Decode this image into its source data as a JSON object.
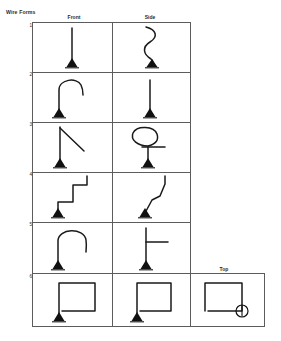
{
  "document": {
    "title": "Wire Forms"
  },
  "table": {
    "headers": {
      "front": "Front",
      "side": "Side",
      "top": "Top"
    },
    "row_numbers": [
      "1",
      "2",
      "3",
      "4",
      "5",
      "6"
    ],
    "rows": [
      {
        "number": "1",
        "front": {
          "shape_name": "straight-vertical-wire-on-base"
        },
        "side": {
          "shape_name": "s-curve-wavy-wire-on-base"
        }
      },
      {
        "number": "2",
        "front": {
          "shape_name": "hook-candy-cane-wire-on-base"
        },
        "side": {
          "shape_name": "straight-vertical-wire-on-base"
        }
      },
      {
        "number": "3",
        "front": {
          "shape_name": "vertical-wire-with-diagonal-branch-on-base"
        },
        "side": {
          "shape_name": "loop-with-horizontal-arm-wire-on-base"
        }
      },
      {
        "number": "4",
        "front": {
          "shape_name": "right-angle-step-wire-on-base"
        },
        "side": {
          "shape_name": "diagonal-zigzag-wire-on-base"
        }
      },
      {
        "number": "5",
        "front": {
          "shape_name": "inverted-u-arch-wire-on-base"
        },
        "side": {
          "shape_name": "vertical-wire-with-horizontal-arm-on-base"
        }
      },
      {
        "number": "6",
        "front": {
          "shape_name": "square-rectangle-wire-on-base"
        },
        "side": {
          "shape_name": "square-rectangle-wire-on-base"
        },
        "top": {
          "shape_name": "square-rectangle-wire-with-circle-marker"
        }
      }
    ]
  },
  "colors": {
    "ink": "#1a1a1a",
    "grid": "#5c5c5c",
    "paper": "#ffffff"
  }
}
